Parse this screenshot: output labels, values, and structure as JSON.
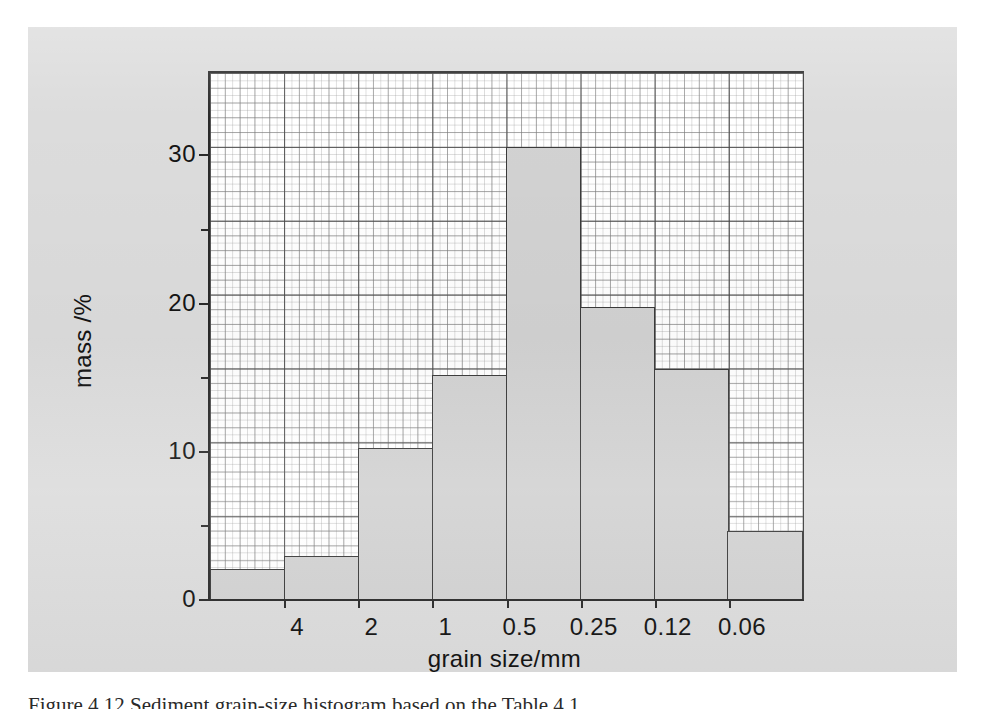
{
  "figure": {
    "caption": "Figure 4.12   Sediment grain-size histogram based on the Table 4.1"
  },
  "chart_data": {
    "type": "bar",
    "title": "",
    "subtitle": "",
    "xlabel": "grain size/mm",
    "ylabel": "mass /%",
    "grid": true,
    "legend": "none",
    "categories": [
      "",
      "4",
      "2",
      "1",
      "0.5",
      "0.25",
      "0.12",
      "0.06"
    ],
    "bin_edge_labels": [
      "4",
      "2",
      "1",
      "0.5",
      "0.25",
      "0.12",
      "0.06"
    ],
    "values": [
      2.0,
      2.9,
      10.2,
      15.1,
      30.5,
      19.7,
      15.5,
      4.6
    ],
    "ylim": [
      0,
      35.5
    ],
    "xlim": [
      0,
      8
    ],
    "ytick_labels": [
      "0",
      "10",
      "20",
      "30"
    ],
    "ytick_values": [
      0,
      10,
      20,
      30
    ],
    "yminor_tick_values": [
      5,
      15,
      25
    ],
    "annotations": []
  },
  "axes": {
    "y_title": "mass /%",
    "x_title": "grain size/mm",
    "y_ticks": [
      {
        "label": "0",
        "value": 0
      },
      {
        "label": "10",
        "value": 10
      },
      {
        "label": "20",
        "value": 20
      },
      {
        "label": "30",
        "value": 30
      }
    ],
    "y_minor_ticks": [
      5,
      15,
      25
    ],
    "x_ticks": [
      {
        "label": "4",
        "index": 1
      },
      {
        "label": "2",
        "index": 2
      },
      {
        "label": "1",
        "index": 3
      },
      {
        "label": "0.5",
        "index": 4
      },
      {
        "label": "0.25",
        "index": 5
      },
      {
        "label": "0.12",
        "index": 6
      },
      {
        "label": "0.06",
        "index": 7
      }
    ]
  },
  "colors": {
    "paper": "#dcdcdc",
    "bar_fill": "#d2d2d2",
    "bar_stroke": "#3a3a3a",
    "axis": "#2a2a2a",
    "grid_major": "#464646",
    "grid_minor": "#969696",
    "plot_background": "#ffffff"
  }
}
